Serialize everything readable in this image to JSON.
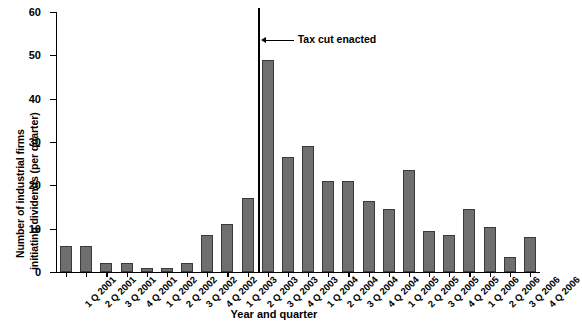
{
  "chart_data": {
    "type": "bar",
    "title": "",
    "xlabel": "Year and quarter",
    "ylabel": "Number of industrial firms initiating dividends (per quarter)",
    "ylabel_line1": "Number of industrial firms",
    "ylabel_line2": "initiating dividends (per quarter)",
    "ylim": [
      0,
      60
    ],
    "yticks": [
      0,
      10,
      20,
      30,
      40,
      50,
      60
    ],
    "grid": false,
    "legend": null,
    "bar_color": "#6f6f6f",
    "bar_edge_color": "#3a3a3a",
    "categories": [
      "1 Q 2001",
      "2 Q 2001",
      "3 Q 2001",
      "4 Q 2001",
      "1 Q 2002",
      "2 Q 2002",
      "3 Q 2002",
      "4 Q 2002",
      "1 Q 2003",
      "2 Q 2003",
      "3 Q 2003",
      "4 Q 2003",
      "1 Q 2004",
      "2 Q 2004",
      "3 Q 2004",
      "4 Q 2004",
      "1 Q 2005",
      "2 Q 2005",
      "3 Q 2005",
      "4 Q 2005",
      "1 Q 2006",
      "2 Q 2006",
      "3 Q 2006",
      "4 Q 2006"
    ],
    "values": [
      6,
      6,
      2,
      2,
      1,
      1,
      2,
      8.5,
      11,
      17,
      49,
      26.5,
      29,
      21,
      21,
      16.5,
      14.5,
      23.5,
      9.5,
      8.5,
      14.5,
      10.5,
      3.5,
      8
    ],
    "annotations": [
      {
        "text": "Tax cut enacted",
        "type": "vertical-line-with-arrow",
        "between_categories": [
          "2 Q 2003",
          "3 Q 2003"
        ],
        "x_index": 10
      }
    ]
  }
}
